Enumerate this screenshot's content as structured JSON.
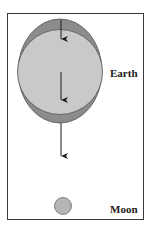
{
  "figure": {
    "type": "tidal bulge diagram",
    "labels": {
      "earth": "Earth",
      "moon": "Moon"
    },
    "colors": {
      "frame_border": "#3a3a3a",
      "tidal_bulge": "#8c8c8c",
      "earth_body": "#c9c9c9",
      "moon_body": "#b5b5b5",
      "arrow": "#1a1a1a"
    },
    "arrows": [
      {
        "position": "near side (top)",
        "direction": "down",
        "length": "short"
      },
      {
        "position": "center",
        "direction": "down",
        "length": "medium"
      },
      {
        "position": "far side (bottom)",
        "direction": "down",
        "length": "long"
      }
    ]
  }
}
